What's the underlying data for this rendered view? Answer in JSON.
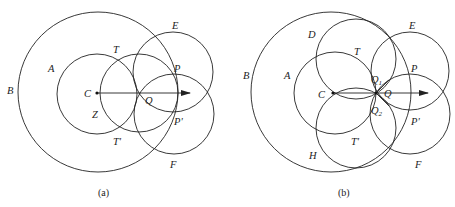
{
  "figure": {
    "panels": [
      {
        "id": "a",
        "caption": "(a)",
        "circles": [
          {
            "name": "B",
            "label": "B"
          },
          {
            "name": "A",
            "label": "A"
          },
          {
            "name": "middle",
            "label": ""
          },
          {
            "name": "E",
            "label": "E"
          },
          {
            "name": "F",
            "label": "F"
          }
        ],
        "points": {
          "C": "C",
          "Q": "Q",
          "T": "T",
          "T_prime": "T'",
          "P": "P",
          "P_prime": "P'",
          "Z": "Z"
        }
      },
      {
        "id": "b",
        "caption": "(b)",
        "circles": [
          {
            "name": "B",
            "label": "B"
          },
          {
            "name": "A",
            "label": "A"
          },
          {
            "name": "D",
            "label": "D"
          },
          {
            "name": "H",
            "label": "H"
          },
          {
            "name": "E",
            "label": "E"
          },
          {
            "name": "F",
            "label": "F"
          }
        ],
        "points": {
          "C": "C",
          "Q": "Q",
          "Q1": "Q",
          "Q1_sub": "1",
          "Q2": "Q",
          "Q2_sub": "2",
          "T": "T",
          "T_prime": "T'",
          "P": "P",
          "P_prime": "P'"
        }
      }
    ]
  }
}
